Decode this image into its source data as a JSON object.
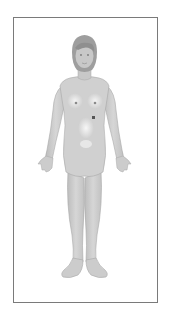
{
  "diagram": {
    "view": "anterior",
    "colors": {
      "frame_border": "#7a7a7a",
      "skin_fill": "#cfcfcf",
      "skin_shade": "#b5b5b5",
      "skin_highlight": "#efefef",
      "hair": "#9a9a9a",
      "outline": "#a0a0a0",
      "marker": "#555555",
      "background": "#ffffff"
    },
    "markers": [
      {
        "name": "small-dark-lesion-marker",
        "x": 93,
        "y": 117
      }
    ]
  }
}
